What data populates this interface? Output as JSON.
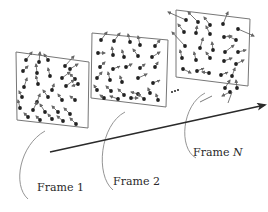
{
  "diagram": {
    "colors": {
      "frame_border": "#777777",
      "dot": "#222222",
      "vector": "#555555",
      "axis_arrow": "#2a2a2a",
      "callout": "#888888",
      "text": "#2a2a2a"
    },
    "frames": [
      {
        "id": "frame-1",
        "label": "Frame 1",
        "label_prefix": "Frame",
        "label_suffix": "1",
        "suffix_italic": false,
        "corners": [
          [
            16,
            52
          ],
          [
            89,
            62
          ],
          [
            88,
            128
          ],
          [
            17,
            120
          ]
        ],
        "label_pos": [
          37,
          182
        ],
        "callout": "M 45 131 C 20 145, 12 185, 28 199",
        "dots": [
          [
            26,
            60,
            32,
            52
          ],
          [
            39,
            62,
            40,
            52
          ],
          [
            48,
            60,
            44,
            54
          ],
          [
            65,
            66,
            74,
            56
          ],
          [
            70,
            69,
            78,
            64
          ],
          [
            23,
            71,
            28,
            66
          ],
          [
            37,
            73,
            36,
            64
          ],
          [
            50,
            76,
            48,
            68
          ],
          [
            62,
            78,
            70,
            72
          ],
          [
            75,
            79,
            70,
            74
          ],
          [
            24,
            87,
            27,
            78
          ],
          [
            38,
            84,
            36,
            76
          ],
          [
            52,
            90,
            54,
            84
          ],
          [
            66,
            86,
            74,
            80
          ],
          [
            78,
            84,
            72,
            86
          ],
          [
            22,
            97,
            19,
            91
          ],
          [
            37,
            102,
            40,
            94
          ],
          [
            48,
            97,
            43,
            90
          ],
          [
            62,
            100,
            58,
            94
          ],
          [
            75,
            100,
            70,
            96
          ],
          [
            20,
            108,
            18,
            100
          ],
          [
            33,
            110,
            37,
            102
          ],
          [
            45,
            112,
            40,
            104
          ],
          [
            58,
            112,
            52,
            106
          ],
          [
            70,
            114,
            64,
            108
          ],
          [
            28,
            117,
            24,
            113
          ],
          [
            40,
            120,
            36,
            116
          ],
          [
            52,
            119,
            48,
            114
          ],
          [
            63,
            121,
            57,
            116
          ],
          [
            76,
            124,
            70,
            118
          ]
        ]
      },
      {
        "id": "frame-2",
        "label": "Frame 2",
        "label_prefix": "Frame",
        "label_suffix": "2",
        "suffix_italic": false,
        "corners": [
          [
            92,
            33
          ],
          [
            168,
            40
          ],
          [
            166,
            107
          ],
          [
            91,
            98
          ]
        ],
        "label_pos": [
          113,
          176
        ],
        "callout": "M 125 112 C 100 125, 95 175, 113 190",
        "dots": [
          [
            101,
            40,
            107,
            32
          ],
          [
            114,
            41,
            120,
            33
          ],
          [
            130,
            42,
            128,
            34
          ],
          [
            140,
            45,
            138,
            36
          ],
          [
            155,
            46,
            160,
            40
          ],
          [
            98,
            53,
            105,
            53
          ],
          [
            113,
            55,
            112,
            47
          ],
          [
            124,
            57,
            122,
            50
          ],
          [
            138,
            56,
            133,
            49
          ],
          [
            152,
            57,
            160,
            52
          ],
          [
            100,
            67,
            105,
            62
          ],
          [
            113,
            69,
            120,
            66
          ],
          [
            126,
            67,
            132,
            64
          ],
          [
            140,
            68,
            145,
            64
          ],
          [
            155,
            67,
            158,
            62
          ],
          [
            97,
            78,
            102,
            72
          ],
          [
            110,
            80,
            108,
            72
          ],
          [
            122,
            82,
            120,
            76
          ],
          [
            138,
            78,
            147,
            74
          ],
          [
            153,
            83,
            160,
            80
          ],
          [
            97,
            90,
            94,
            85
          ],
          [
            111,
            91,
            106,
            86
          ],
          [
            124,
            95,
            118,
            89
          ],
          [
            138,
            94,
            131,
            92
          ],
          [
            150,
            93,
            148,
            88
          ],
          [
            104,
            98,
            100,
            95
          ],
          [
            118,
            99,
            110,
            96
          ],
          [
            131,
            98,
            138,
            98
          ],
          [
            144,
            99,
            138,
            94
          ],
          [
            158,
            100,
            156,
            94
          ]
        ]
      },
      {
        "id": "frame-n",
        "label": "Frame N",
        "label_prefix": "Frame",
        "label_suffix": "N",
        "suffix_italic": true,
        "corners": [
          [
            176,
            10
          ],
          [
            250,
            19
          ],
          [
            248,
            86
          ],
          [
            176,
            77
          ]
        ],
        "label_pos": [
          193,
          147
        ],
        "callout": "M 205 93 C 182 105, 178 148, 196 158",
        "dots": [
          [
            186,
            20,
            168,
            12
          ],
          [
            198,
            22,
            188,
            12
          ],
          [
            210,
            25,
            204,
            17
          ],
          [
            223,
            24,
            228,
            12
          ],
          [
            238,
            29,
            254,
            36
          ],
          [
            184,
            32,
            178,
            24
          ],
          [
            196,
            33,
            197,
            26
          ],
          [
            210,
            34,
            206,
            26
          ],
          [
            224,
            37,
            232,
            36
          ],
          [
            236,
            40,
            228,
            36
          ],
          [
            185,
            46,
            172,
            32
          ],
          [
            200,
            48,
            203,
            38
          ],
          [
            213,
            50,
            212,
            42
          ],
          [
            225,
            52,
            234,
            45
          ],
          [
            238,
            52,
            246,
            50
          ],
          [
            182,
            58,
            180,
            50
          ],
          [
            196,
            60,
            194,
            52
          ],
          [
            210,
            58,
            206,
            52
          ],
          [
            224,
            61,
            232,
            58
          ],
          [
            236,
            64,
            244,
            60
          ],
          [
            183,
            69,
            191,
            73
          ],
          [
            197,
            71,
            204,
            68
          ],
          [
            209,
            73,
            202,
            72
          ],
          [
            221,
            75,
            228,
            72
          ],
          [
            232,
            76,
            235,
            68
          ],
          [
            225,
            88,
            230,
            80
          ],
          [
            237,
            88,
            236,
            80
          ],
          [
            230,
            92,
            222,
            96
          ]
        ],
        "outside_vectors": [
          [
            212,
            96,
            200,
            102
          ],
          [
            232,
            92,
            228,
            103
          ]
        ]
      }
    ],
    "ellipsis": {
      "text": "…",
      "dots": [
        [
          172,
          92
        ],
        [
          175,
          91
        ],
        [
          178,
          90
        ]
      ]
    },
    "axis_arrow": {
      "from": [
        50,
        152
      ],
      "to": [
        265,
        105
      ],
      "meaning": "time / frame sequence direction"
    }
  }
}
